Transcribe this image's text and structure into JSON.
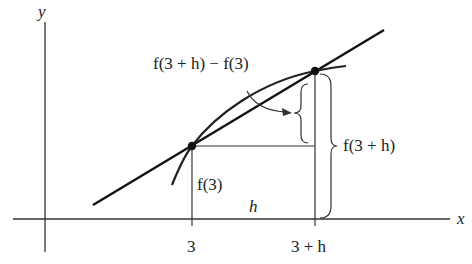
{
  "diagram": {
    "title": "",
    "axes": {
      "x_label": "x",
      "y_label": "y"
    },
    "tick_labels": {
      "a": "3",
      "a_plus_h": "3 + h"
    },
    "annotations": {
      "difference": "f(3 + h) − f(3)",
      "f_a_plus_h": "f(3 + h)",
      "f_a": "f(3)",
      "h": "h"
    },
    "points": [
      {
        "name": "P",
        "x_label": "3",
        "y_label": "f(3)"
      },
      {
        "name": "Q",
        "x_label": "3 + h",
        "y_label": "f(3 + h)"
      }
    ],
    "elements": [
      "curve y = f(x)",
      "secant line through P and Q",
      "horizontal segment of length h",
      "vertical segments f(3) and f(3 + h)",
      "brace for f(3 + h) − f(3)",
      "brace for f(3 + h)"
    ],
    "colors": {
      "ink": "#1a1a1a",
      "axis": "#333333",
      "background": "#ffffff"
    }
  }
}
